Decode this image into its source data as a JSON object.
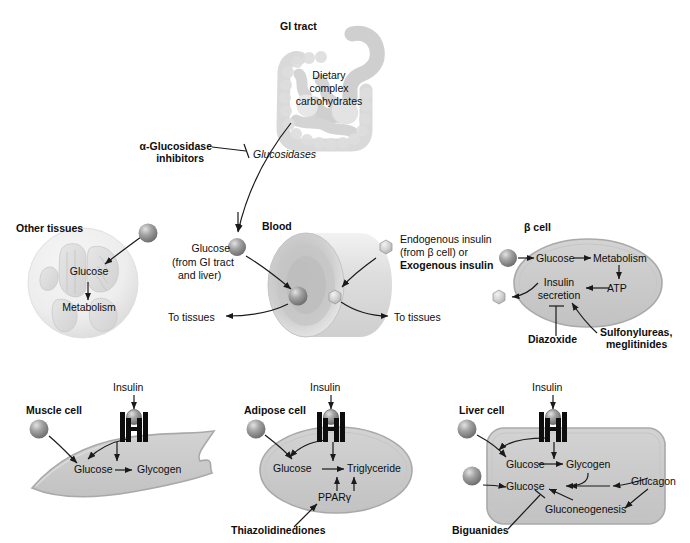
{
  "figure": {
    "type": "biomedical-pathway-diagram"
  },
  "panels": {
    "gi_tract": {
      "heading": "GI tract",
      "inside_label": [
        "Dietary",
        "complex",
        "carbohydrates"
      ],
      "enzyme_label": "Glucosidases",
      "drug_label": [
        "α-Glucosidase",
        "inhibitors"
      ],
      "drug_effect": "inhibition"
    },
    "blood": {
      "heading": "Blood",
      "glucose_source": [
        "Glucose",
        "(from GI tract",
        "and liver)"
      ],
      "insulin_source": [
        "Endogenous insulin",
        "(from β cell) or",
        "Exogenous insulin"
      ],
      "insulin_source_bold_line": "Exogenous insulin",
      "to_tissues_left": "To tissues",
      "to_tissues_right": "To tissues"
    },
    "other_tissues": {
      "heading": "Other tissues",
      "nodes": [
        "Glucose",
        "Metabolism"
      ]
    },
    "beta_cell": {
      "heading": "β cell",
      "nodes": [
        "Glucose",
        "Metabolism",
        "ATP",
        "Insulin",
        "secretion"
      ],
      "drug_inhibitor": "Diazoxide",
      "drug_stimulator": [
        "Sulfonylureas,",
        "meglitinides"
      ]
    },
    "muscle_cell": {
      "heading": "Muscle cell",
      "hormone": "Insulin",
      "nodes": [
        "Glucose",
        "Glycogen"
      ]
    },
    "adipose_cell": {
      "heading": "Adipose cell",
      "hormone": "Insulin",
      "nodes": [
        "Glucose",
        "Triglyceride",
        "PPARγ"
      ],
      "drug_stimulator": "Thiazolidinediones"
    },
    "liver_cell": {
      "heading": "Liver cell",
      "hormone": "Insulin",
      "nodes": [
        "Glucose",
        "Glycogen",
        "Glucose",
        "Gluconeogenesis"
      ],
      "hormone_right": "Glucagon",
      "drug_inhibitor": "Biguanides"
    }
  },
  "legend_shapes": {
    "glucose_molecule": "gray-sphere",
    "insulin_molecule": "light-hexagon",
    "insulin_receptor": "black-receptor-icon"
  },
  "colors": {
    "tissue_fill": "#c9c9c9",
    "tissue_stroke": "#8f8f8f",
    "organ_tint": "#d8d8d8",
    "stroke": "#1a1a1a",
    "text": "#0d0d0d",
    "sphere_dark": "#808080",
    "sphere_light": "#d5d5d5"
  }
}
